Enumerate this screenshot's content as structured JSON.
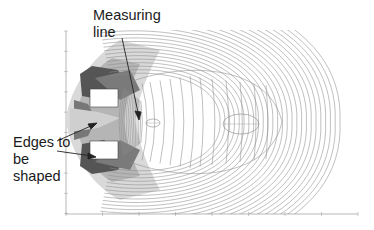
{
  "annotations": {
    "measuring_line": {
      "line1": "Measuring",
      "line2": "line"
    },
    "edges": {
      "line1": "Edges to",
      "line2": "be",
      "line3": "shaped"
    }
  },
  "plot": {
    "type": "contour",
    "axis_color": "#888888",
    "contour_color": "#8a8a8a",
    "electrode_count": 2,
    "x_ticks": 9,
    "y_ticks": 10
  }
}
